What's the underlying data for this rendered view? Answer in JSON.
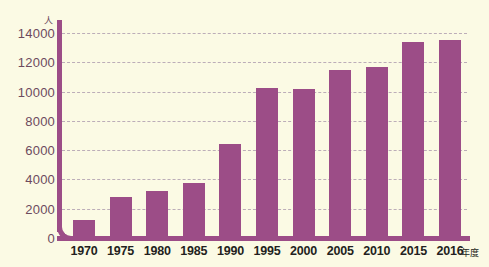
{
  "chart_data": {
    "type": "bar",
    "title": "",
    "subtitle": "",
    "xlabel": "年度",
    "ylabel": "人",
    "categories": [
      "1970",
      "1975",
      "1980",
      "1985",
      "1990",
      "1995",
      "2000",
      "2005",
      "2010",
      "2015",
      "2016"
    ],
    "values": [
      1250,
      2800,
      3200,
      3750,
      6400,
      10250,
      10150,
      11450,
      11700,
      13400,
      13550
    ],
    "ylim": [
      0,
      14000
    ],
    "yticks": [
      0,
      2000,
      4000,
      6000,
      8000,
      10000,
      12000,
      14000
    ],
    "ytick_labels": [
      "0",
      "2000",
      "4000",
      "6000",
      "8000",
      "10000",
      "12000",
      "14000"
    ],
    "grid": true,
    "legend": false,
    "legend_position": "none",
    "colors": {
      "bar": "#9c4d87",
      "axis": "#9c4d87",
      "grid": "#b9a9b6",
      "background": "#fbfae4",
      "y_tick_text": "#6d4a5e",
      "x_tick_text": "#231f20"
    }
  }
}
